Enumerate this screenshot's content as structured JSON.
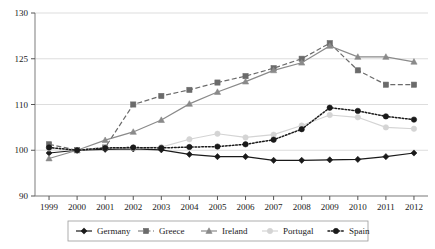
{
  "chart_data": {
    "type": "line",
    "title": "",
    "xlabel": "",
    "ylabel": "",
    "categories": [
      "1999",
      "2000",
      "2001",
      "2002",
      "2003",
      "2004",
      "2005",
      "2006",
      "2007",
      "2008",
      "2009",
      "2010",
      "2011",
      "2012"
    ],
    "ytick_labels": [
      "130",
      "125",
      "110",
      "100",
      "90"
    ],
    "ytick_values": [
      130,
      125,
      110,
      100,
      90
    ],
    "yaxis_note": "non-linear axis: ticks evenly spaced in pixels though intervals differ",
    "ylim": [
      90,
      130
    ],
    "grid": "horizontal",
    "legend_position": "bottom",
    "series": [
      {
        "name": "Germany",
        "marker": "diamond",
        "line_style": "solid",
        "color": "#1a1a1a",
        "values": [
          99.4,
          100.0,
          100.2,
          100.3,
          100.1,
          99.1,
          98.6,
          98.6,
          97.8,
          97.8,
          97.9,
          98.0,
          98.6,
          99.4
        ]
      },
      {
        "name": "Greece",
        "marker": "square",
        "line_style": "dashed",
        "color": "#6b6b6b",
        "values": [
          101.3,
          100.0,
          100.6,
          110.0,
          112.8,
          114.8,
          117.2,
          119.3,
          121.9,
          125.0,
          126.7,
          121.2,
          116.5,
          116.5
        ]
      },
      {
        "name": "Ireland",
        "marker": "triangle",
        "line_style": "solid",
        "color": "#8a8a8a",
        "values": [
          98.2,
          100.0,
          102.2,
          104.0,
          106.6,
          110.2,
          114.1,
          117.5,
          121.2,
          123.7,
          126.4,
          125.2,
          125.2,
          124.0
        ]
      },
      {
        "name": "Portugal",
        "marker": "circle",
        "line_style": "solid",
        "color": "#d4d4d4",
        "values": [
          100.4,
          100.0,
          100.6,
          100.5,
          100.7,
          102.4,
          103.6,
          102.8,
          103.4,
          105.4,
          107.7,
          107.2,
          105.0,
          104.7
        ]
      },
      {
        "name": "Spain",
        "marker": "circle",
        "line_style": "dotted",
        "color": "#1a1a1a",
        "values": [
          100.6,
          100.0,
          100.5,
          100.6,
          100.5,
          100.7,
          100.8,
          101.3,
          102.3,
          104.6,
          109.3,
          108.6,
          107.4,
          106.7
        ]
      }
    ]
  },
  "legend": {
    "items": [
      {
        "label": "Germany"
      },
      {
        "label": "Greece"
      },
      {
        "label": "Ireland"
      },
      {
        "label": "Portugal"
      },
      {
        "label": "Spain"
      }
    ]
  }
}
